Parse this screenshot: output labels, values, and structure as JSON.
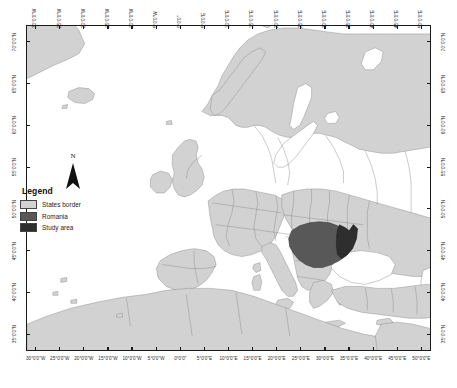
{
  "figure": {
    "kind": "map",
    "projection_note": "Geographic (lat/lon) graticule"
  },
  "colors": {
    "ocean": "#ffffff",
    "land": "#d2d2d2",
    "states_border_fill": "#d2d2d2",
    "states_border_line": "#8a8a8a",
    "romania_fill": "#585858",
    "study_area_fill": "#2e2e2e",
    "frame": "#1a1a1a",
    "text": "#2b2b2b",
    "coastline": "#7d7d7d"
  },
  "axes": {
    "longitude_labels": [
      "30°0'0\"W",
      "25°0'0\"W",
      "20°0'0\"W",
      "15°0'0\"W",
      "10°0'0\"W",
      "5°0'0\"W",
      "0°0'0\"",
      "5°0'0\"E",
      "10°0'0\"E",
      "15°0'0\"E",
      "20°0'0\"E",
      "25°0'0\"E",
      "30°0'0\"E",
      "35°0'0\"E",
      "40°0'0\"E",
      "45°0'0\"E",
      "50°0'0\"E"
    ],
    "longitude_values": [
      -30,
      -25,
      -20,
      -15,
      -10,
      -5,
      0,
      5,
      10,
      15,
      20,
      25,
      30,
      35,
      40,
      45,
      50
    ],
    "latitude_labels": [
      "70°0'0\"N",
      "65°0'0\"N",
      "60°0'0\"N",
      "55°0'0\"N",
      "50°0'0\"N",
      "45°0'0\"N",
      "40°0'0\"N",
      "35°0'0\"N"
    ],
    "latitude_values": [
      70,
      65,
      60,
      55,
      50,
      45,
      40,
      35
    ],
    "lon_range": [
      -32,
      52
    ],
    "lat_range": [
      33,
      72
    ]
  },
  "legend": {
    "title": "Legend",
    "items": [
      {
        "label": "States border",
        "color": "#d2d2d2"
      },
      {
        "label": "Romania",
        "color": "#585858"
      },
      {
        "label": "Study area",
        "color": "#2e2e2e"
      }
    ]
  },
  "north_arrow": {
    "letter": "N"
  }
}
